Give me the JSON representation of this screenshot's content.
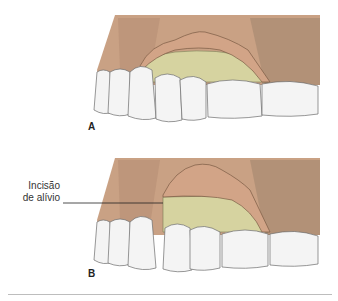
{
  "figure": {
    "panels": [
      {
        "id": "A",
        "label": "A",
        "description": "Maxillary teeth with envelope flap reflected exposing alveolar bone"
      },
      {
        "id": "B",
        "label": "B",
        "description": "Maxillary teeth with flap including relief incision reflected"
      }
    ],
    "callout": {
      "line1": "Incisão",
      "line2": "de alívio"
    },
    "colors": {
      "gingiva": "#c9a184",
      "gingiva_dark": "#a07a5e",
      "flap": "#d2a487",
      "bone": "#d6d3a0",
      "teeth": "#f4f4f4",
      "tooth_outline": "#6b6b6b",
      "text": "#222222",
      "rule": "#bdbdbd"
    }
  }
}
